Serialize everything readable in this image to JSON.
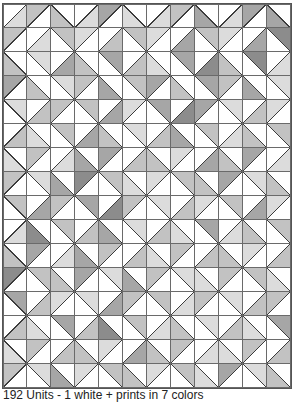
{
  "figure": {
    "columns": 12,
    "rows": 16,
    "cell_size_px": 24,
    "legend": {
      "A": "diagonal from bottom-left to top-right (/)",
      "Z": "diagonal from top-left to bottom-right (\\)",
      "T": "upper half shaded",
      "B": "lower half shaded",
      "levels": {
        "0": "#ffffff",
        "1": "#dcdcdc",
        "2": "#c2c2c2",
        "3": "#a6a6a6",
        "4": "#8c8c8c"
      }
    },
    "colors": {
      "background": "#ffffff",
      "grid_line": "#6a6a6a",
      "diagonal_line": "#3c3c3c",
      "empty_half": "#ffffff"
    },
    "grid": [
      [
        "A-B1",
        "A-T2",
        "Z-B2",
        "A-B1",
        "A-T3",
        "Z-B1",
        "A-B1",
        "A-T2",
        "Z-B3",
        "A-B1",
        "A-T3",
        "Z-B3"
      ],
      [
        "A-T2",
        "A-B1",
        "Z-T2",
        "A-T1",
        "A-B2",
        "Z-T2",
        "A-T1",
        "A-B3",
        "Z-T2",
        "A-T1",
        "A-B3",
        "Z-T4"
      ],
      [
        "Z-B2",
        "Z-T1",
        "A-B3",
        "Z-B2",
        "Z-T3",
        "A-B2",
        "Z-B1",
        "Z-T3",
        "A-B4",
        "Z-B2",
        "Z-T4",
        "A-B1"
      ],
      [
        "A-T3",
        "Z-B2",
        "Z-T1",
        "A-T2",
        "Z-B3",
        "Z-T2",
        "A-T3",
        "Z-B2",
        "Z-T3",
        "A-T2",
        "Z-B3",
        "Z-T1"
      ],
      [
        "Z-T1",
        "A-B2",
        "A-T2",
        "Z-T2",
        "A-B3",
        "A-T1",
        "Z-T3",
        "A-B4",
        "A-T3",
        "Z-T1",
        "A-B2",
        "A-T1"
      ],
      [
        "A-B2",
        "Z-B1",
        "Z-T2",
        "A-B3",
        "Z-B2",
        "Z-T1",
        "A-B2",
        "Z-B3",
        "Z-T2",
        "A-B1",
        "Z-B2",
        "Z-T2"
      ],
      [
        "Z-B1",
        "A-T2",
        "A-B1",
        "Z-B3",
        "A-T3",
        "A-B2",
        "Z-B2",
        "A-T1",
        "A-B3",
        "Z-B2",
        "A-T3",
        "A-B1"
      ],
      [
        "A-T2",
        "Z-T1",
        "Z-B3",
        "A-T4",
        "Z-T2",
        "Z-B1",
        "A-T1",
        "Z-T2",
        "Z-B2",
        "A-T3",
        "Z-T1",
        "Z-B2"
      ],
      [
        "Z-T2",
        "A-B3",
        "A-T2",
        "Z-T3",
        "A-B4",
        "A-T2",
        "Z-T1",
        "A-B2",
        "A-T1",
        "Z-T2",
        "A-B3",
        "A-T1"
      ],
      [
        "A-B1",
        "Z-B4",
        "Z-T2",
        "A-B2",
        "Z-B3",
        "Z-T1",
        "A-B2",
        "Z-B1",
        "Z-T3",
        "A-B1",
        "Z-B2",
        "Z-T2"
      ],
      [
        "Z-B2",
        "A-T3",
        "A-B1",
        "Z-B3",
        "A-T2",
        "A-B2",
        "Z-B1",
        "A-T2",
        "A-B2",
        "Z-B2",
        "A-T1",
        "A-B2"
      ],
      [
        "A-T4",
        "Z-T2",
        "Z-B2",
        "A-T3",
        "Z-T1",
        "Z-B3",
        "A-T2",
        "Z-T1",
        "Z-B1",
        "A-T2",
        "Z-T2",
        "Z-B1"
      ],
      [
        "Z-T3",
        "A-B2",
        "A-T1",
        "Z-T1",
        "A-B3",
        "A-T2",
        "Z-T2",
        "A-B1",
        "A-T2",
        "Z-T1",
        "A-B2",
        "A-T2"
      ],
      [
        "A-B2",
        "Z-B1",
        "Z-T3",
        "A-B2",
        "Z-B4",
        "Z-T2",
        "A-B1",
        "Z-B2",
        "Z-T1",
        "A-B2",
        "Z-B1",
        "Z-T3"
      ],
      [
        "Z-B1",
        "A-T2",
        "A-B2",
        "Z-B2",
        "A-T1",
        "A-B3",
        "Z-B2",
        "A-T2",
        "A-B1",
        "Z-B1",
        "A-T2",
        "A-B2"
      ],
      [
        "A-T2",
        "Z-T1",
        "Z-B3",
        "A-T1",
        "Z-T2",
        "Z-B2",
        "A-T1",
        "Z-T2",
        "Z-B1",
        "A-T3",
        "Z-T1",
        "Z-B2"
      ]
    ]
  },
  "caption": "192 Units - 1 white + prints in 7 colors"
}
